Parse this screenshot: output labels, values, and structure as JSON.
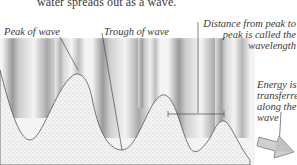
{
  "diagram": {
    "caption": "water spreads out as a wave.",
    "labels": {
      "peak": "Peak of wave",
      "trough": "Trough of wave",
      "distance_line1": "Distance from peak to",
      "distance_line2": "peak is called the",
      "distance_line3": "wavelength",
      "energy_line1": "Energy is",
      "energy_line2": "transferre",
      "energy_line3": "along the",
      "energy_line4": "wave"
    },
    "icons": {
      "arrow": "direction-arrow-right"
    },
    "colors": {
      "line": "#4a4a4a",
      "water_dark": "#6e6e6e",
      "water_light": "#f2f2f2",
      "stipple": "#d8d8d8",
      "arrow_fill": "#c9c9c9"
    }
  }
}
